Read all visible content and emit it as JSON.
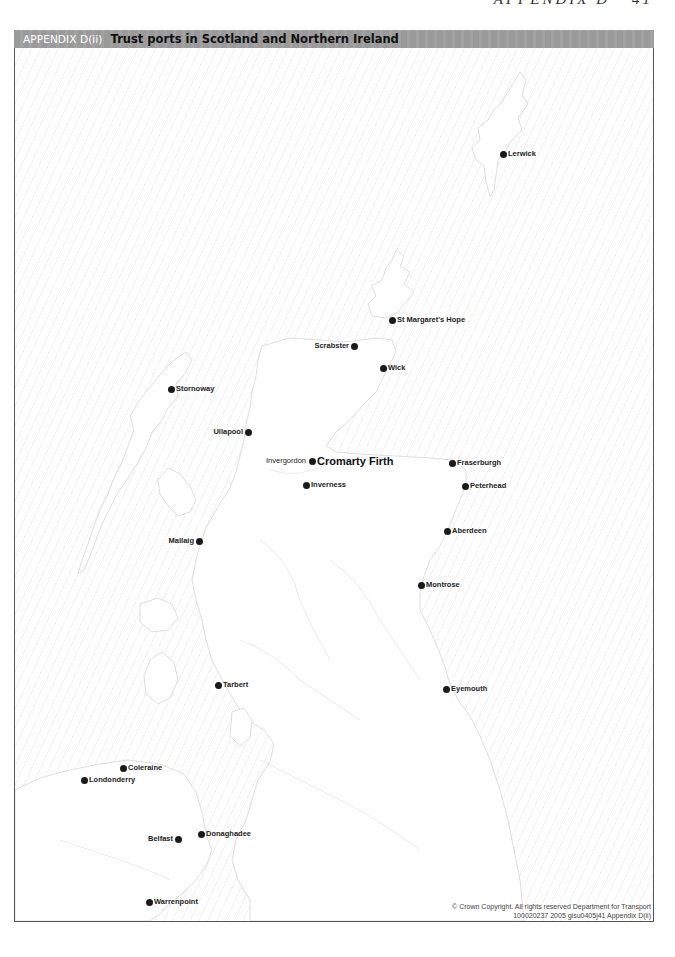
{
  "page": {
    "header": "APPENDIX D",
    "page_number": "41"
  },
  "title_bar": {
    "prefix": "APPENDIX D(ii)",
    "title": "Trust ports in Scotland and Northern Ireland"
  },
  "map": {
    "sea_hatch_color": "#f3f3f3",
    "coast_color": "#d6d6d6",
    "dot_color": "#1a1a1a",
    "ports": [
      {
        "name": "Lerwick",
        "x": 503,
        "y": 154,
        "side": "right"
      },
      {
        "name": "St Margaret's Hope",
        "x": 392,
        "y": 320,
        "side": "right"
      },
      {
        "name": "Scrabster",
        "x": 354,
        "y": 346,
        "side": "left"
      },
      {
        "name": "Wick",
        "x": 383,
        "y": 368,
        "side": "right"
      },
      {
        "name": "Stornoway",
        "x": 171,
        "y": 389,
        "side": "right"
      },
      {
        "name": "Ullapool",
        "x": 248,
        "y": 432,
        "side": "left"
      },
      {
        "name": "Cromarty Firth",
        "x": 312,
        "y": 461,
        "side": "right",
        "emphasis": true,
        "secondary_label": "Invergordon"
      },
      {
        "name": "Inverness",
        "x": 306,
        "y": 485,
        "side": "right"
      },
      {
        "name": "Fraserburgh",
        "x": 452,
        "y": 463,
        "side": "right"
      },
      {
        "name": "Peterhead",
        "x": 465,
        "y": 486,
        "side": "right"
      },
      {
        "name": "Aberdeen",
        "x": 447,
        "y": 531,
        "side": "right"
      },
      {
        "name": "Mallaig",
        "x": 199,
        "y": 541,
        "side": "left"
      },
      {
        "name": "Montrose",
        "x": 421,
        "y": 585,
        "side": "right"
      },
      {
        "name": "Tarbert",
        "x": 218,
        "y": 685,
        "side": "right"
      },
      {
        "name": "Eyemouth",
        "x": 446,
        "y": 689,
        "side": "right"
      },
      {
        "name": "Coleraine",
        "x": 123,
        "y": 768,
        "side": "right"
      },
      {
        "name": "Londonderry",
        "x": 84,
        "y": 780,
        "side": "right"
      },
      {
        "name": "Belfast",
        "x": 178,
        "y": 839,
        "side": "left"
      },
      {
        "name": "Donaghadee",
        "x": 201,
        "y": 834,
        "side": "right"
      },
      {
        "name": "Warrenpoint",
        "x": 149,
        "y": 902,
        "side": "right"
      }
    ]
  },
  "copyright": {
    "line1": "© Crown Copyright. All rights reserved Department for Transport",
    "line2": "100020237 2005 gisu0405j41 Appendix D(ii)"
  }
}
